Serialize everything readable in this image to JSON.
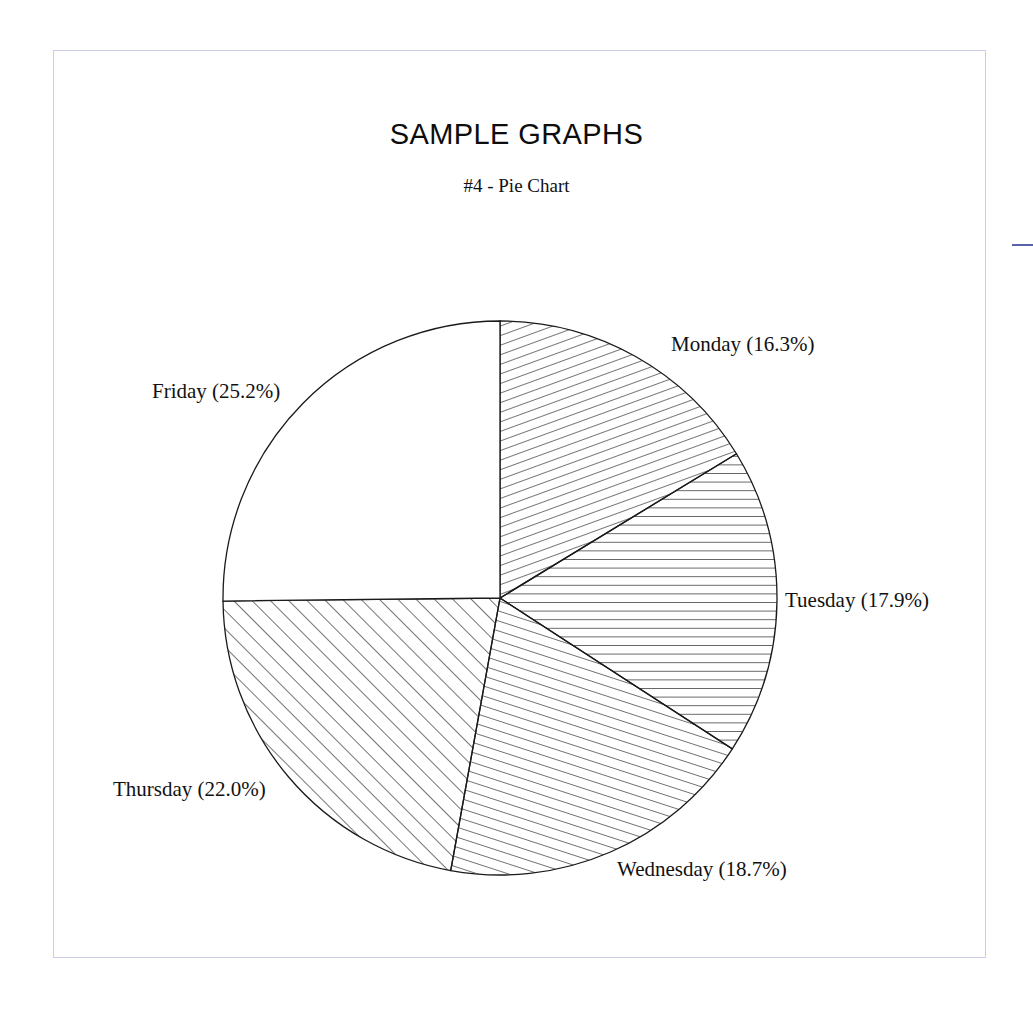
{
  "document": {
    "title": "SAMPLE GRAPHS",
    "subtitle": "#4 - Pie Chart"
  },
  "frame": {
    "border_color": "#7a86bd",
    "background": "#ffffff"
  },
  "edge_mark": {
    "name": "right-edge-tick",
    "color": "#5a63a8"
  },
  "labels": {
    "monday": "Monday (16.3%)",
    "tuesday": "Tuesday (17.9%)",
    "wednesday": "Wednesday (18.7%)",
    "thursday": "Thursday (22.0%)",
    "friday": "Friday (25.2%)"
  },
  "chart_data": {
    "type": "pie",
    "title": "SAMPLE GRAPHS",
    "subtitle": "#4 - Pie Chart",
    "xlabel": "",
    "ylabel": "",
    "categories": [
      "Monday",
      "Tuesday",
      "Wednesday",
      "Thursday",
      "Friday"
    ],
    "values": [
      16.3,
      17.9,
      18.7,
      22.0,
      25.2
    ],
    "value_unit": "percent",
    "total": 100.1,
    "start_angle_deg": 90,
    "direction": "clockwise",
    "legend": "none",
    "labels_position": "outside-radial",
    "grid": false,
    "slices": [
      {
        "label": "Monday (16.3%)",
        "category": "Monday",
        "value": 16.3,
        "fill": "diagonal-hatch-steep-right",
        "start_deg": 0.0,
        "end_deg": 58.68
      },
      {
        "label": "Tuesday (17.9%)",
        "category": "Tuesday",
        "value": 17.9,
        "fill": "horizontal-hatch",
        "start_deg": 58.68,
        "end_deg": 123.12
      },
      {
        "label": "Wednesday (18.7%)",
        "category": "Wednesday",
        "value": 18.7,
        "fill": "diagonal-hatch-steep-left",
        "start_deg": 123.12,
        "end_deg": 190.44
      },
      {
        "label": "Thursday (22.0%)",
        "category": "Thursday",
        "value": 22.0,
        "fill": "diagonal-hatch-45",
        "start_deg": 190.44,
        "end_deg": 269.64
      },
      {
        "label": "Friday (25.2%)",
        "category": "Friday",
        "value": 25.2,
        "fill": "blank-white",
        "start_deg": 269.64,
        "end_deg": 360.0
      }
    ],
    "geometry": {
      "center_x": 500,
      "center_y": 598,
      "radius": 277
    },
    "stroke_color": "#1a1a1a"
  }
}
